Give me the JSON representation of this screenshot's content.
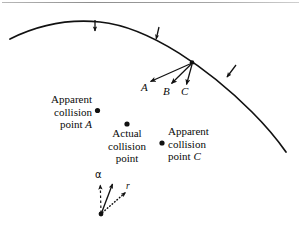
{
  "figure": {
    "title_line": "horizontal-rule",
    "arc": {
      "name": "shock-front-arc",
      "stroke": "#111111",
      "description": "curved shock front arc across top of figure"
    },
    "arc_arrows": [
      {
        "name": "arc-normal-arrow-1",
        "x": 95,
        "y": 22,
        "angle": 95
      },
      {
        "name": "arc-normal-arrow-2",
        "x": 157,
        "y": 31,
        "angle": 117
      },
      {
        "name": "arc-normal-arrow-3",
        "x": 229,
        "y": 72,
        "angle": 140
      }
    ],
    "vectors": {
      "origin": {
        "x": 192,
        "y": 63
      },
      "items": [
        {
          "label": "A",
          "tip_x": 149,
          "tip_y": 83,
          "label_x": 143,
          "label_y": 83
        },
        {
          "label": "B",
          "tip_x": 170,
          "tip_y": 85,
          "label_x": 164,
          "label_y": 87
        },
        {
          "label": "C",
          "tip_x": 186,
          "tip_y": 86,
          "label_x": 182,
          "label_y": 87
        }
      ]
    },
    "points": [
      {
        "name": "apparent-collision-point-a",
        "dot_x": 97,
        "dot_y": 111,
        "label_lines": [
          "Apparent",
          "collision",
          "point A"
        ],
        "italic_tail": "A"
      },
      {
        "name": "actual-collision-point",
        "dot_x": 127,
        "dot_y": 124,
        "label_lines": [
          "Actual",
          "collision",
          "point"
        ],
        "italic_tail": ""
      },
      {
        "name": "apparent-collision-point-c",
        "dot_x": 162,
        "dot_y": 143,
        "label_lines": [
          "Apparent",
          "collision",
          "point C"
        ],
        "italic_tail": "C"
      }
    ],
    "inset": {
      "name": "alpha-r-vector-inset",
      "base_x": 101,
      "base_y": 214,
      "alpha_label": "α",
      "alpha_label_x": 96,
      "alpha_label_y": 170,
      "r_label": "r",
      "r_label_x": 127,
      "r_label_y": 186,
      "dashed_arrow": {
        "name": "alpha-dashed-arrow",
        "tip_x": 100,
        "tip_y": 184
      },
      "solid_arrow": {
        "name": "resultant-solid-arrow",
        "tip_x": 113,
        "tip_y": 183
      },
      "dotted_arrow": {
        "name": "r-dotted-arrow",
        "tip_x": 126,
        "tip_y": 191
      }
    }
  },
  "text": {
    "apparent_a_line1": "Apparent",
    "apparent_a_line2": "collision",
    "apparent_a_line3_prefix": "point ",
    "apparent_a_line3_italic": "A",
    "actual_line1": "Actual",
    "actual_line2": "collision",
    "actual_line3": "point",
    "apparent_c_line1": "Apparent",
    "apparent_c_line2": "collision",
    "apparent_c_line3_prefix": "point ",
    "apparent_c_line3_italic": "C",
    "vec_a": "A",
    "vec_b": "B",
    "vec_c": "C",
    "alpha": "α",
    "r": "r"
  }
}
